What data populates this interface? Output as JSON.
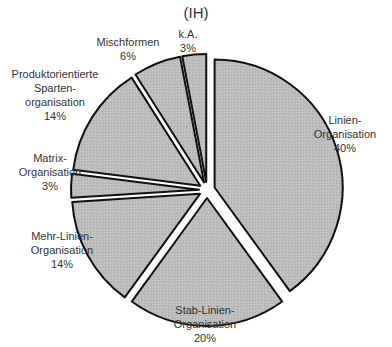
{
  "chart_data": {
    "type": "pie",
    "title": "(IH)",
    "start_angle": "12 o'clock, clockwise",
    "exploded": true,
    "fill_color": "#bdbdbd",
    "stroke_color": "#111111",
    "slices": [
      {
        "label": "Linien-Organisation",
        "value": 40
      },
      {
        "label": "Stab-Linien-Organisation",
        "value": 20
      },
      {
        "label": "Mehr-Linien-Organisation",
        "value": 14
      },
      {
        "label": "Matrix-Organisation",
        "value": 3
      },
      {
        "label": "Produktorientierte Sparten-organisation",
        "value": 14
      },
      {
        "label": "Mischformen",
        "value": 6
      },
      {
        "label": "k.A.",
        "value": 3
      }
    ]
  },
  "title": "(IH)",
  "labels": {
    "linien": {
      "l1": "Linien-",
      "l2": "Organisation",
      "pct": "40%"
    },
    "stab": {
      "l1": "Stab-Linien-",
      "l2": "Organisation",
      "pct": "20%"
    },
    "mehr": {
      "l1": "Mehr-Linien-",
      "l2": "Organisation",
      "pct": "14%"
    },
    "matrix": {
      "l1": "Matrix-",
      "l2": "Organisation",
      "pct": "3%"
    },
    "produkt": {
      "l1": "Produktorientierte",
      "l2": "Sparten-",
      "l3": "organisation",
      "pct": "14%"
    },
    "misch": {
      "l1": "Mischformen",
      "pct": "6%"
    },
    "ka": {
      "l1": "k.A.",
      "pct": "3%"
    }
  }
}
